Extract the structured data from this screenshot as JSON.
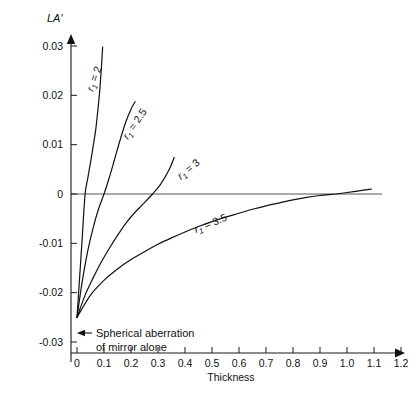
{
  "chart_data": {
    "type": "line",
    "title": "",
    "xlabel": "Thickness",
    "ylabel": "LA'",
    "xlim": [
      0,
      1.2
    ],
    "ylim": [
      -0.03,
      0.03
    ],
    "grid": false,
    "legend_position": "inline-curve-labels",
    "xticks": [
      "0",
      "0.1",
      "0.2",
      "0.3",
      "0.4",
      "0.5",
      "0.6",
      "0.7",
      "0.8",
      "0.9",
      "1.0",
      "1.1",
      "1.2"
    ],
    "xtick_values": [
      0,
      0.1,
      0.2,
      0.3,
      0.4,
      0.5,
      0.6,
      0.7,
      0.8,
      0.9,
      1.0,
      1.1,
      1.2
    ],
    "yticks": [
      "0.03",
      "0.02",
      "0.01",
      "0",
      "-0.01",
      "-0.02",
      "-0.03"
    ],
    "ytick_values": [
      0.03,
      0.02,
      0.01,
      0,
      -0.01,
      -0.02,
      -0.03
    ],
    "common_origin": {
      "x": 0,
      "y": -0.025
    },
    "zero_reference_line": 0,
    "series": [
      {
        "name": "r1 = 2",
        "label": "r₁ = 2",
        "label_prefix": "r",
        "label_subscript": "1",
        "label_suffix": " = 2",
        "zero_crossing_x": 0.03,
        "points": [
          [
            0.0,
            -0.025
          ],
          [
            0.01,
            -0.0167
          ],
          [
            0.02,
            -0.0083
          ],
          [
            0.03,
            0.0
          ],
          [
            0.04,
            0.0032
          ],
          [
            0.05,
            0.0064
          ],
          [
            0.06,
            0.0097
          ],
          [
            0.07,
            0.0133
          ],
          [
            0.08,
            0.0185
          ],
          [
            0.085,
            0.0215
          ],
          [
            0.09,
            0.0253
          ],
          [
            0.095,
            0.0298
          ]
        ]
      },
      {
        "name": "r1 = 2.5",
        "label": "r₁ = 2.5",
        "label_prefix": "r",
        "label_subscript": "1",
        "label_suffix": " = 2.5",
        "zero_crossing_x": 0.1,
        "points": [
          [
            0.0,
            -0.025
          ],
          [
            0.02,
            -0.0175
          ],
          [
            0.04,
            -0.0115
          ],
          [
            0.06,
            -0.0068
          ],
          [
            0.08,
            -0.003
          ],
          [
            0.1,
            0.0
          ],
          [
            0.12,
            0.0034
          ],
          [
            0.14,
            0.0072
          ],
          [
            0.16,
            0.011
          ],
          [
            0.18,
            0.0145
          ],
          [
            0.2,
            0.0172
          ],
          [
            0.215,
            0.0187
          ]
        ]
      },
      {
        "name": "r1 = 3",
        "label": "r₁ = 3",
        "label_prefix": "r",
        "label_subscript": "1",
        "label_suffix": " = 3",
        "zero_crossing_x": 0.28,
        "points": [
          [
            0.0,
            -0.025
          ],
          [
            0.03,
            -0.0205
          ],
          [
            0.06,
            -0.017
          ],
          [
            0.09,
            -0.0138
          ],
          [
            0.12,
            -0.011
          ],
          [
            0.15,
            -0.0084
          ],
          [
            0.18,
            -0.006
          ],
          [
            0.21,
            -0.004
          ],
          [
            0.24,
            -0.0023
          ],
          [
            0.28,
            0.0
          ],
          [
            0.31,
            0.002
          ],
          [
            0.34,
            0.0048
          ],
          [
            0.36,
            0.0074
          ]
        ]
      },
      {
        "name": "r1 = 3.5",
        "label": "r₁ = 3.5",
        "label_prefix": "r",
        "label_subscript": "1",
        "label_suffix": " = 3.5",
        "zero_crossing_x": 0.96,
        "points": [
          [
            0.0,
            -0.025
          ],
          [
            0.05,
            -0.0205
          ],
          [
            0.1,
            -0.0175
          ],
          [
            0.15,
            -0.0152
          ],
          [
            0.2,
            -0.0133
          ],
          [
            0.25,
            -0.0117
          ],
          [
            0.3,
            -0.0102
          ],
          [
            0.35,
            -0.0089
          ],
          [
            0.4,
            -0.0077
          ],
          [
            0.45,
            -0.0066
          ],
          [
            0.5,
            -0.0056
          ],
          [
            0.55,
            -0.0047
          ],
          [
            0.6,
            -0.0039
          ],
          [
            0.65,
            -0.0031
          ],
          [
            0.7,
            -0.0024
          ],
          [
            0.75,
            -0.0018
          ],
          [
            0.8,
            -0.0012
          ],
          [
            0.85,
            -0.0007
          ],
          [
            0.9,
            -0.0003
          ],
          [
            0.96,
            0.0
          ],
          [
            1.0,
            0.0003
          ],
          [
            1.05,
            0.0007
          ],
          [
            1.09,
            0.001
          ]
        ]
      }
    ],
    "annotations": [
      {
        "name": "spherical-aberration-note",
        "line1": "Spherical aberration",
        "line2": "of mirror alone",
        "points_to": [
          0,
          -0.025
        ]
      }
    ]
  },
  "curve_labels": [
    {
      "text_prefix": "r",
      "sub": "1",
      "suffix": " = 2",
      "x": 93,
      "y": 92,
      "rotate": -70
    },
    {
      "text_prefix": "r",
      "sub": "1",
      "suffix": " = 2.5",
      "x": 128,
      "y": 140,
      "rotate": -56
    },
    {
      "text_prefix": "r",
      "sub": "1",
      "suffix": " = 3",
      "x": 181,
      "y": 180,
      "rotate": -40
    },
    {
      "text_prefix": "r",
      "sub": "1",
      "suffix": " = 3.5",
      "x": 196,
      "y": 233,
      "rotate": -22
    }
  ],
  "axes": {
    "y_title": "LA′",
    "x_title": "Thickness"
  }
}
